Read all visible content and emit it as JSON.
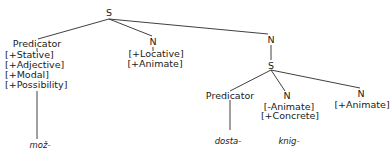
{
  "tree": {
    "root": {
      "label": "S"
    },
    "predicator_1": {
      "label": "Predicator",
      "features": [
        "[+Stative]",
        "[+Adjective]",
        "[+Modal]",
        "[+Possibility]"
      ],
      "word": "mož-"
    },
    "n_1": {
      "label": "N",
      "features": [
        "[+Locative]",
        "[+Animate]"
      ]
    },
    "n_2": {
      "label": "N"
    },
    "s_embedded": {
      "label": "S"
    },
    "predicator_2": {
      "label": "Predicator",
      "word": "dosta-"
    },
    "n_3": {
      "label": "N",
      "features": [
        "[-Animate]",
        "[+Concrete]"
      ],
      "word": "knig-"
    },
    "n_4": {
      "label": "N",
      "features": [
        "[+Animate]"
      ]
    }
  },
  "colors": {
    "line": "#2a2a2a",
    "text": "#1a1a1a",
    "background": "#ffffff"
  }
}
